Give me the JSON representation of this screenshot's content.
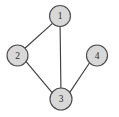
{
  "figure": {
    "name": "undirected-graph",
    "type": "node-link-diagram",
    "background_color": "#ffffff",
    "width": 119,
    "height": 117
  },
  "style": {
    "node_fill": "#d8d8d8",
    "node_stroke": "#4c4c4c",
    "node_stroke_width": 1.15,
    "node_radius": 10.5,
    "edge_stroke": "#3f3f3f",
    "edge_stroke_width": 1.15,
    "label_color": "#2b2b2b",
    "label_font_size": 9.5
  },
  "graph": {
    "directed": false,
    "node_count": 4,
    "edge_count": 4,
    "nodes": [
      {
        "id": "1",
        "label": "1",
        "cx": 60,
        "cy": 16,
        "r": 10.5
      },
      {
        "id": "2",
        "label": "2",
        "cx": 17.5,
        "cy": 55.5,
        "r": 10.5
      },
      {
        "id": "3",
        "label": "3",
        "cx": 61,
        "cy": 99,
        "r": 11
      },
      {
        "id": "4",
        "label": "4",
        "cx": 97,
        "cy": 55.5,
        "r": 10.5
      }
    ],
    "edges": [
      {
        "id": "1-2",
        "source": "1",
        "target": "2",
        "x1": 52.5,
        "y1": 23.4,
        "x2": 24.9,
        "y2": 48.2
      },
      {
        "id": "1-3",
        "source": "1",
        "target": "3",
        "x1": 60.1,
        "y1": 26.5,
        "x2": 60.9,
        "y2": 88.0
      },
      {
        "id": "2-3",
        "source": "2",
        "target": "3",
        "x1": 26.1,
        "y1": 61.6,
        "x2": 52.1,
        "y2": 92.7
      },
      {
        "id": "3-4",
        "source": "3",
        "target": "4",
        "x1": 69.8,
        "y1": 92.4,
        "x2": 89.9,
        "y2": 62.3
      }
    ]
  }
}
